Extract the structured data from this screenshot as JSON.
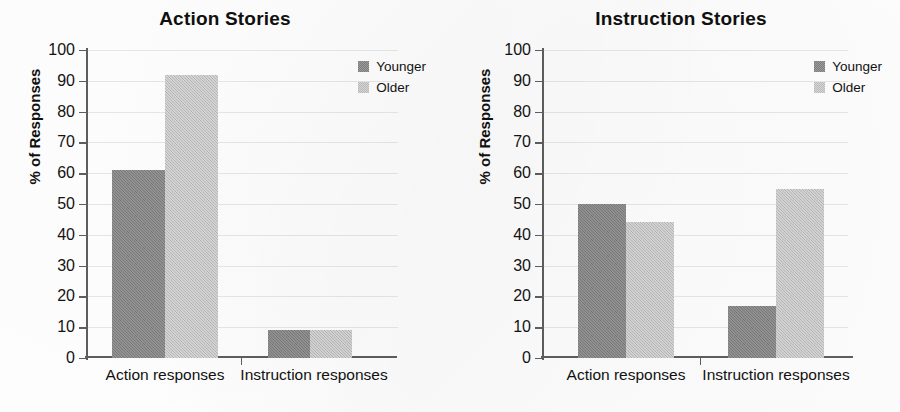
{
  "figure": {
    "panels": [
      "left",
      "right"
    ]
  },
  "chart_data": [
    {
      "type": "bar",
      "title": "Action Stories",
      "xlabel": "",
      "ylabel": "% of Responses",
      "categories": [
        "Action responses",
        "Instruction responses"
      ],
      "series": [
        {
          "name": "Younger",
          "color": "#848484",
          "values": [
            61,
            9
          ]
        },
        {
          "name": "Older",
          "color": "#cacaca",
          "values": [
            92,
            9
          ]
        }
      ],
      "ylim": [
        0,
        100
      ],
      "ytick_step": 10,
      "yticks": [
        100,
        90,
        80,
        70,
        60,
        50,
        40,
        30,
        20,
        10,
        0
      ],
      "grid": true,
      "legend_position": "top-right",
      "legend_entries": [
        "Younger",
        "Older"
      ]
    },
    {
      "type": "bar",
      "title": "Instruction Stories",
      "xlabel": "",
      "ylabel": "% of Responses",
      "categories": [
        "Action responses",
        "Instruction responses"
      ],
      "series": [
        {
          "name": "Younger",
          "color": "#848484",
          "values": [
            50,
            17
          ]
        },
        {
          "name": "Older",
          "color": "#cacaca",
          "values": [
            44,
            55
          ]
        }
      ],
      "ylim": [
        0,
        100
      ],
      "ytick_step": 10,
      "yticks": [
        100,
        90,
        80,
        70,
        60,
        50,
        40,
        30,
        20,
        10,
        0
      ],
      "grid": true,
      "legend_position": "top-right",
      "legend_entries": [
        "Younger",
        "Older"
      ]
    }
  ]
}
